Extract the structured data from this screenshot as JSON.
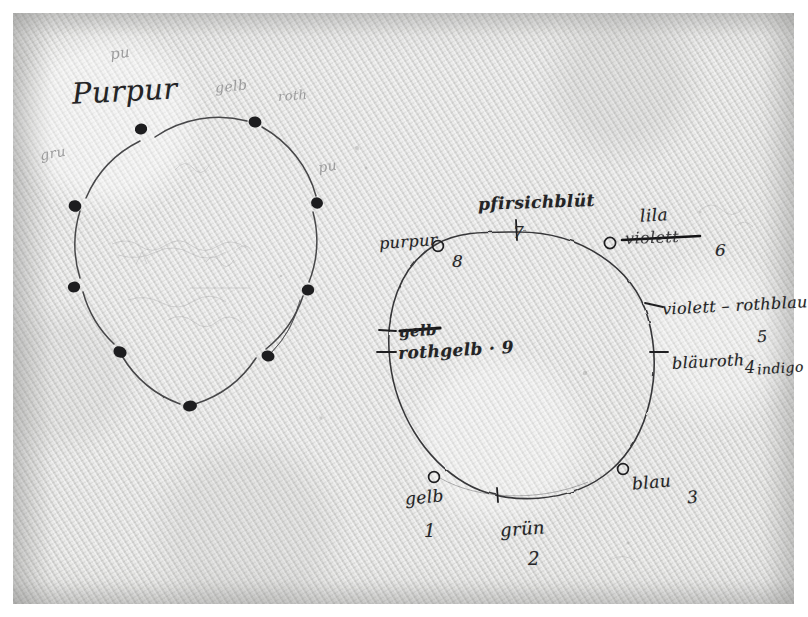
{
  "document": {
    "kind": "handwritten-manuscript-scan",
    "medium_note": "ink and pencil on laid paper",
    "paper_color": "#d8d8d6",
    "ink_color": "#232325",
    "pencil_color": "#8f8f90",
    "border_color": "#ffffff"
  },
  "left_diagram": {
    "title": "Purpur",
    "point_count": 9,
    "marker_style": "filled-dot",
    "faint_pencil_marks": [
      {
        "text": "pu",
        "note": "faint pencil above title"
      },
      {
        "text": "roth",
        "note": "faint pencil upper right of top-right dot"
      },
      {
        "text": "gelb",
        "note": "faint pencil right side"
      },
      {
        "text": "gru",
        "note": "faint pencil left side"
      },
      {
        "text": "pu",
        "note": "faint pencil far right"
      }
    ],
    "points": [
      {
        "index": 1,
        "angle_deg": 250,
        "label": ""
      },
      {
        "index": 2,
        "angle_deg": 290,
        "label": ""
      },
      {
        "index": 3,
        "angle_deg": 330,
        "label": ""
      },
      {
        "index": 4,
        "angle_deg": 10,
        "label": ""
      },
      {
        "index": 5,
        "angle_deg": 50,
        "label": ""
      },
      {
        "index": 6,
        "angle_deg": 90,
        "label": ""
      },
      {
        "index": 7,
        "angle_deg": 130,
        "label": ""
      },
      {
        "index": 8,
        "angle_deg": 170,
        "label": ""
      },
      {
        "index": 9,
        "angle_deg": 210,
        "label": ""
      }
    ]
  },
  "right_diagram": {
    "marker_styles": {
      "open": "open-circle",
      "tick": "tick-mark"
    },
    "entries": [
      {
        "number": "1",
        "label": "gelb",
        "marker": "open",
        "struck": "",
        "extra": ""
      },
      {
        "number": "2",
        "label": "grün",
        "marker": "tick",
        "struck": "",
        "extra": ""
      },
      {
        "number": "3",
        "label": "blau",
        "marker": "open",
        "struck": "",
        "extra": ""
      },
      {
        "number": "4",
        "label": "bläuroth",
        "marker": "tick",
        "struck": "",
        "extra": "indigo"
      },
      {
        "number": "5",
        "label": "violett – rothblau",
        "marker": "tick",
        "struck": "",
        "extra": ""
      },
      {
        "number": "6",
        "label": "lila",
        "marker": "open",
        "struck": "violett",
        "extra": ""
      },
      {
        "number": "7",
        "label": "pfirsichblüt",
        "marker": "tick",
        "struck": "",
        "extra": ""
      },
      {
        "number": "8",
        "label": "purpur",
        "marker": "open",
        "struck": "",
        "extra": ""
      },
      {
        "number": "9",
        "label": "rothgelb",
        "marker": "tick",
        "struck": "gelb",
        "extra": ""
      }
    ]
  },
  "annotations": {
    "left_title": "Purpur",
    "r_purpur": "purpur",
    "r_purpur_num": "8",
    "r_pfirsich": "pfirsichblüt",
    "r_pfirsich_num": "7",
    "r_lila": "lila",
    "r_violett_struck": "violett",
    "r_lila_num": "6",
    "r_violett_rothblau": "violett – rothblau",
    "r_violett_rothblau_num": "5",
    "r_blauroth": "bläuroth",
    "r_blauroth_num": "4",
    "r_indigo": "indigo",
    "r_gelb_struck": "gelb",
    "r_rothgelb": "rothgelb · 9",
    "r_gelb": "gelb",
    "r_gelb_num": "1",
    "r_gruen": "grün",
    "r_gruen_num": "2",
    "r_blau": "blau",
    "r_blau_num": "3",
    "p_pu_top": "pu",
    "p_roth_top": "roth",
    "p_gelb_right": "gelb",
    "p_gru_left": "gru",
    "p_pu_far_right": "pu"
  }
}
